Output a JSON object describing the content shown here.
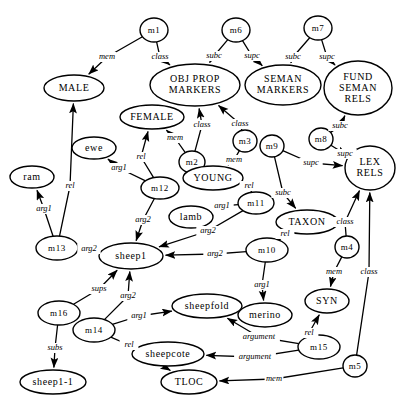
{
  "diagram": {
    "background": "#ffffff",
    "stroke_color": "#000000",
    "nodes": [
      {
        "id": "m1",
        "label": "m1",
        "shape": "circle",
        "cx": 154,
        "cy": 30,
        "rx": 14,
        "ry": 12,
        "fs": 9
      },
      {
        "id": "m6",
        "label": "m6",
        "shape": "circle",
        "cx": 236,
        "cy": 30,
        "rx": 14,
        "ry": 12,
        "fs": 9
      },
      {
        "id": "m7",
        "label": "m7",
        "shape": "circle",
        "cx": 318,
        "cy": 28,
        "rx": 14,
        "ry": 12,
        "fs": 9
      },
      {
        "id": "male",
        "label": "MALE",
        "shape": "ellipse",
        "cx": 74,
        "cy": 88,
        "rx": 30,
        "ry": 13,
        "fs": 10
      },
      {
        "id": "objpropmarkers",
        "label": "OBJ PROP|MARKERS",
        "shape": "ellipse",
        "cx": 195,
        "cy": 85,
        "rx": 45,
        "ry": 21,
        "fs": 10
      },
      {
        "id": "semanmarkers",
        "label": "SEMAN|MARKERS",
        "shape": "ellipse",
        "cx": 283,
        "cy": 85,
        "rx": 38,
        "ry": 20,
        "fs": 10
      },
      {
        "id": "fundsemanrels",
        "label": "FUND|SEMAN|RELS",
        "shape": "ellipse",
        "cx": 358,
        "cy": 88,
        "rx": 34,
        "ry": 27,
        "fs": 10
      },
      {
        "id": "female",
        "label": "FEMALE",
        "shape": "ellipse",
        "cx": 152,
        "cy": 117,
        "rx": 32,
        "ry": 12,
        "fs": 10
      },
      {
        "id": "m3",
        "label": "m3",
        "shape": "circle",
        "cx": 245,
        "cy": 141,
        "rx": 12,
        "ry": 11,
        "fs": 9
      },
      {
        "id": "m8",
        "label": "m8",
        "shape": "circle",
        "cx": 321,
        "cy": 139,
        "rx": 12,
        "ry": 11,
        "fs": 9
      },
      {
        "id": "m9",
        "label": "m9",
        "shape": "circle",
        "cx": 272,
        "cy": 146,
        "rx": 12,
        "ry": 11,
        "fs": 9
      },
      {
        "id": "lexrels",
        "label": "LEX|RELS",
        "shape": "ellipse",
        "cx": 370,
        "cy": 168,
        "rx": 25,
        "ry": 22,
        "fs": 10
      },
      {
        "id": "ewe",
        "label": "ewe",
        "shape": "ellipse",
        "cx": 94,
        "cy": 148,
        "rx": 22,
        "ry": 11,
        "fs": 10
      },
      {
        "id": "m2",
        "label": "m2",
        "shape": "circle",
        "cx": 192,
        "cy": 162,
        "rx": 13,
        "ry": 11,
        "fs": 9
      },
      {
        "id": "young",
        "label": "YOUNG",
        "shape": "ellipse",
        "cx": 213,
        "cy": 178,
        "rx": 30,
        "ry": 12,
        "fs": 10
      },
      {
        "id": "ram",
        "label": "ram",
        "shape": "ellipse",
        "cx": 32,
        "cy": 177,
        "rx": 22,
        "ry": 11,
        "fs": 10
      },
      {
        "id": "m12",
        "label": "m12",
        "shape": "ellipse",
        "cx": 160,
        "cy": 188,
        "rx": 19,
        "ry": 11,
        "fs": 9
      },
      {
        "id": "m11",
        "label": "m11",
        "shape": "ellipse",
        "cx": 256,
        "cy": 203,
        "rx": 18,
        "ry": 11,
        "fs": 9
      },
      {
        "id": "lamb",
        "label": "lamb",
        "shape": "ellipse",
        "cx": 191,
        "cy": 217,
        "rx": 22,
        "ry": 11,
        "fs": 10
      },
      {
        "id": "taxon",
        "label": "TAXON",
        "shape": "ellipse",
        "cx": 307,
        "cy": 222,
        "rx": 31,
        "ry": 12,
        "fs": 10
      },
      {
        "id": "m13",
        "label": "m13",
        "shape": "ellipse",
        "cx": 57,
        "cy": 248,
        "rx": 21,
        "ry": 12,
        "fs": 9
      },
      {
        "id": "m10",
        "label": "m10",
        "shape": "ellipse",
        "cx": 267,
        "cy": 250,
        "rx": 21,
        "ry": 12,
        "fs": 9
      },
      {
        "id": "m4",
        "label": "m4",
        "shape": "circle",
        "cx": 347,
        "cy": 247,
        "rx": 12,
        "ry": 11,
        "fs": 9
      },
      {
        "id": "sheep1",
        "label": "sheep1",
        "shape": "ellipse",
        "cx": 131,
        "cy": 256,
        "rx": 32,
        "ry": 13,
        "fs": 10
      },
      {
        "id": "m16",
        "label": "m16",
        "shape": "ellipse",
        "cx": 59,
        "cy": 313,
        "rx": 21,
        "ry": 12,
        "fs": 9
      },
      {
        "id": "sheepfold",
        "label": "sheepfold",
        "shape": "ellipse",
        "cx": 207,
        "cy": 306,
        "rx": 35,
        "ry": 12,
        "fs": 10
      },
      {
        "id": "merino",
        "label": "merino",
        "shape": "ellipse",
        "cx": 265,
        "cy": 315,
        "rx": 27,
        "ry": 12,
        "fs": 10
      },
      {
        "id": "syn",
        "label": "SYN",
        "shape": "ellipse",
        "cx": 327,
        "cy": 301,
        "rx": 22,
        "ry": 12,
        "fs": 10
      },
      {
        "id": "m14",
        "label": "m14",
        "shape": "ellipse",
        "cx": 94,
        "cy": 330,
        "rx": 21,
        "ry": 12,
        "fs": 9
      },
      {
        "id": "m15",
        "label": "m15",
        "shape": "ellipse",
        "cx": 319,
        "cy": 347,
        "rx": 21,
        "ry": 12,
        "fs": 9
      },
      {
        "id": "sheepcote",
        "label": "sheepcote",
        "shape": "ellipse",
        "cx": 168,
        "cy": 354,
        "rx": 36,
        "ry": 12,
        "fs": 10
      },
      {
        "id": "m5",
        "label": "m5",
        "shape": "circle",
        "cx": 355,
        "cy": 366,
        "rx": 12,
        "ry": 11,
        "fs": 9
      },
      {
        "id": "sheep1-1",
        "label": "sheep1-1",
        "shape": "ellipse",
        "cx": 53,
        "cy": 382,
        "rx": 33,
        "ry": 12,
        "fs": 10
      },
      {
        "id": "tloc",
        "label": "TLOC",
        "shape": "ellipse",
        "cx": 189,
        "cy": 382,
        "rx": 28,
        "ry": 12,
        "fs": 10
      }
    ],
    "edges": [
      {
        "from": "m1",
        "to": "male",
        "label": "mem",
        "lx": 107,
        "ly": 57
      },
      {
        "from": "m1",
        "to": "objpropmarkers",
        "label": "class",
        "lx": 160,
        "ly": 57
      },
      {
        "from": "m6",
        "to": "objpropmarkers",
        "label": "subc",
        "lx": 214,
        "ly": 56
      },
      {
        "from": "m6",
        "to": "semanmarkers",
        "label": "supc",
        "lx": 252,
        "ly": 56
      },
      {
        "from": "m7",
        "to": "semanmarkers",
        "label": "subc",
        "lx": 293,
        "ly": 57
      },
      {
        "from": "m7",
        "to": "fundsemanrels",
        "label": "supc",
        "lx": 327,
        "ly": 57
      },
      {
        "from": "m2",
        "to": "female",
        "label": "mem",
        "lx": 175,
        "ly": 138
      },
      {
        "from": "m2",
        "to": "objpropmarkers",
        "label": "class",
        "lx": 202,
        "ly": 125
      },
      {
        "from": "m3",
        "to": "objpropmarkers",
        "label": "class",
        "lx": 240,
        "ly": 124
      },
      {
        "from": "m3",
        "to": "young",
        "label": "mem",
        "lx": 234,
        "ly": 160
      },
      {
        "from": "m8",
        "to": "fundsemanrels",
        "label": "subc",
        "lx": 340,
        "ly": 126
      },
      {
        "from": "m8",
        "to": "lexrels",
        "label": "supc",
        "lx": 345,
        "ly": 154
      },
      {
        "from": "m9",
        "to": "lexrels",
        "label": "supc",
        "lx": 311,
        "ly": 163
      },
      {
        "from": "m9",
        "to": "taxon",
        "label": "subc",
        "lx": 283,
        "ly": 193
      },
      {
        "from": "m12",
        "to": "ewe",
        "label": "arg1",
        "lx": 119,
        "ly": 168
      },
      {
        "from": "m12",
        "to": "female",
        "label": "rel",
        "lx": 141,
        "ly": 157
      },
      {
        "from": "m12",
        "to": "sheep1",
        "label": "arg2",
        "lx": 143,
        "ly": 220
      },
      {
        "from": "m13",
        "to": "ram",
        "label": "arg1",
        "lx": 44,
        "ly": 209
      },
      {
        "from": "m13",
        "to": "male",
        "label": "rel",
        "lx": 70,
        "ly": 186
      },
      {
        "from": "m13",
        "to": "sheep1",
        "label": "arg2",
        "lx": 89,
        "ly": 249
      },
      {
        "from": "m11",
        "to": "young",
        "label": "rel",
        "lx": 249,
        "ly": 186
      },
      {
        "from": "m11",
        "to": "lamb",
        "label": "arg1",
        "lx": 222,
        "ly": 206
      },
      {
        "from": "m11",
        "to": "sheep1",
        "label": "arg2",
        "lx": 208,
        "ly": 231
      },
      {
        "from": "m10",
        "to": "taxon",
        "label": "rel",
        "lx": 285,
        "ly": 234
      },
      {
        "from": "m10",
        "to": "sheep1",
        "label": "arg2",
        "lx": 215,
        "ly": 254
      },
      {
        "from": "m10",
        "to": "merino",
        "label": "arg1",
        "lx": 262,
        "ly": 285
      },
      {
        "from": "m4",
        "to": "lexrels",
        "label": "class",
        "lx": 345,
        "ly": 222
      },
      {
        "from": "m4",
        "to": "syn",
        "label": "mem",
        "lx": 334,
        "ly": 272
      },
      {
        "from": "m16",
        "to": "sheep1",
        "label": "sups",
        "lx": 99,
        "ly": 289
      },
      {
        "from": "m16",
        "to": "sheep1-1",
        "label": "subs",
        "lx": 55,
        "ly": 348
      },
      {
        "from": "m14",
        "to": "sheep1",
        "label": "arg2",
        "lx": 128,
        "ly": 296
      },
      {
        "from": "m14",
        "to": "sheepfold",
        "label": "arg1",
        "lx": 139,
        "ly": 316
      },
      {
        "from": "m14",
        "to": "tloc",
        "label": "rel",
        "lx": 129,
        "ly": 345
      },
      {
        "from": "m15",
        "to": "syn",
        "label": "rel",
        "lx": 309,
        "ly": 333
      },
      {
        "from": "m15",
        "to": "sheepfold",
        "label": "argument",
        "lx": 259,
        "ly": 337
      },
      {
        "from": "m15",
        "to": "sheepcote",
        "label": "argument",
        "lx": 255,
        "ly": 357
      },
      {
        "from": "m5",
        "to": "lexrels",
        "label": "class",
        "lx": 369,
        "ly": 272
      },
      {
        "from": "m5",
        "to": "tloc",
        "label": "mem",
        "lx": 274,
        "ly": 379
      }
    ],
    "edge_labels": [
      "mem",
      "class",
      "subc",
      "supc",
      "rel",
      "arg1",
      "arg2",
      "sups",
      "subs",
      "argument"
    ]
  }
}
